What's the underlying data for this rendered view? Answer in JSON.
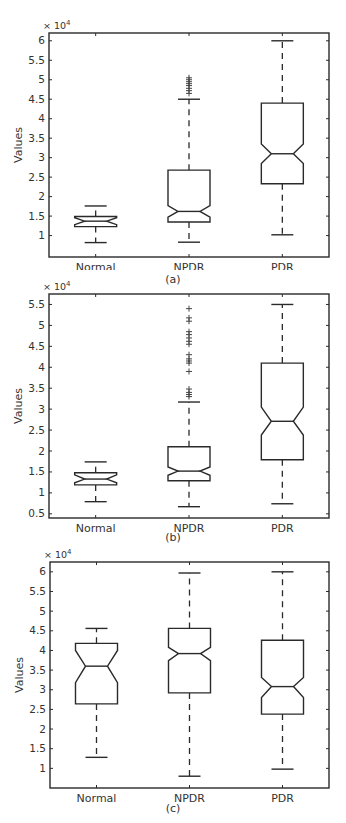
{
  "figure": {
    "panels": [
      {
        "caption": "(a)"
      },
      {
        "caption": "(b)"
      },
      {
        "caption": "(c)"
      }
    ]
  },
  "chart_data": [
    {
      "type": "boxplot",
      "panel": "(a)",
      "title": "",
      "xlabel": "",
      "ylabel": "Values",
      "y_multiplier": "× 10^4",
      "ylim": [
        0.45,
        6.2
      ],
      "yticks": [
        1,
        1.5,
        2,
        2.5,
        3,
        3.5,
        4,
        4.5,
        5,
        5.5,
        6
      ],
      "ytick_labels": [
        "1",
        "1.5",
        "2",
        "2.5",
        "3",
        "3.5",
        "4",
        "4.5",
        "5",
        "5.5",
        "6"
      ],
      "notched": true,
      "grid": false,
      "categories": [
        "Normal",
        "NPDR",
        "PDR"
      ],
      "boxes": [
        {
          "name": "Normal",
          "whisker_low": 0.82,
          "q1": 1.23,
          "notch_low": 1.28,
          "median": 1.37,
          "notch_high": 1.46,
          "q3": 1.49,
          "whisker_high": 1.76,
          "outliers": []
        },
        {
          "name": "NPDR",
          "whisker_low": 0.83,
          "q1": 1.35,
          "notch_low": 1.47,
          "median": 1.62,
          "notch_high": 1.77,
          "q3": 2.68,
          "whisker_high": 4.5,
          "outliers": [
            4.65,
            4.72,
            4.78,
            4.85,
            4.9,
            4.95,
            5.0,
            5.05
          ]
        },
        {
          "name": "PDR",
          "whisker_low": 1.02,
          "q1": 2.33,
          "notch_low": 2.85,
          "median": 3.1,
          "notch_high": 3.35,
          "q3": 4.4,
          "whisker_high": 6.0,
          "outliers": []
        }
      ]
    },
    {
      "type": "boxplot",
      "panel": "(b)",
      "title": "",
      "xlabel": "",
      "ylabel": "Values",
      "y_multiplier": "× 10^4",
      "ylim": [
        0.4,
        5.75
      ],
      "yticks": [
        0.5,
        1,
        1.5,
        2,
        2.5,
        3,
        3.5,
        4,
        4.5,
        5,
        5.5
      ],
      "ytick_labels": [
        "0.5",
        "1",
        "1.5",
        "2",
        "2.5",
        "3",
        "3.5",
        "4",
        "4.5",
        "5",
        "5.5"
      ],
      "notched": true,
      "grid": false,
      "categories": [
        "Normal",
        "NPDR",
        "PDR"
      ],
      "boxes": [
        {
          "name": "Normal",
          "whisker_low": 0.79,
          "q1": 1.19,
          "notch_low": 1.24,
          "median": 1.33,
          "notch_high": 1.43,
          "q3": 1.48,
          "whisker_high": 1.74,
          "outliers": []
        },
        {
          "name": "NPDR",
          "whisker_low": 0.67,
          "q1": 1.29,
          "notch_low": 1.42,
          "median": 1.52,
          "notch_high": 1.62,
          "q3": 2.1,
          "whisker_high": 3.17,
          "outliers": [
            3.3,
            3.35,
            3.4,
            3.48,
            3.9,
            4.1,
            4.15,
            4.2,
            4.3,
            4.55,
            4.62,
            4.7,
            4.78,
            4.85,
            5.1,
            5.18,
            5.4
          ]
        },
        {
          "name": "PDR",
          "whisker_low": 0.74,
          "q1": 1.79,
          "notch_low": 2.38,
          "median": 2.71,
          "notch_high": 3.05,
          "q3": 4.1,
          "whisker_high": 5.5,
          "outliers": []
        }
      ]
    },
    {
      "type": "boxplot",
      "panel": "(c)",
      "title": "",
      "xlabel": "",
      "ylabel": "Values",
      "y_multiplier": "× 10^4",
      "ylim": [
        0.5,
        6.25
      ],
      "yticks": [
        1,
        1.5,
        2,
        2.5,
        3,
        3.5,
        4,
        4.5,
        5,
        5.5,
        6
      ],
      "ytick_labels": [
        "1",
        "1.5",
        "2",
        "2.5",
        "3",
        "3.5",
        "4",
        "4.5",
        "5",
        "5.5",
        "6"
      ],
      "notched": true,
      "grid": false,
      "categories": [
        "Normal",
        "NPDR",
        "PDR"
      ],
      "boxes": [
        {
          "name": "Normal",
          "whisker_low": 1.28,
          "q1": 2.64,
          "notch_low": 3.18,
          "median": 3.6,
          "notch_high": 4.0,
          "q3": 4.18,
          "whisker_high": 4.56,
          "outliers": []
        },
        {
          "name": "NPDR",
          "whisker_low": 0.8,
          "q1": 2.92,
          "notch_low": 3.74,
          "median": 3.92,
          "notch_high": 4.08,
          "q3": 4.56,
          "whisker_high": 5.97,
          "outliers": []
        },
        {
          "name": "PDR",
          "whisker_low": 0.98,
          "q1": 2.38,
          "notch_low": 2.8,
          "median": 3.08,
          "notch_high": 3.31,
          "q3": 4.26,
          "whisker_high": 6.0,
          "outliers": []
        }
      ]
    }
  ]
}
